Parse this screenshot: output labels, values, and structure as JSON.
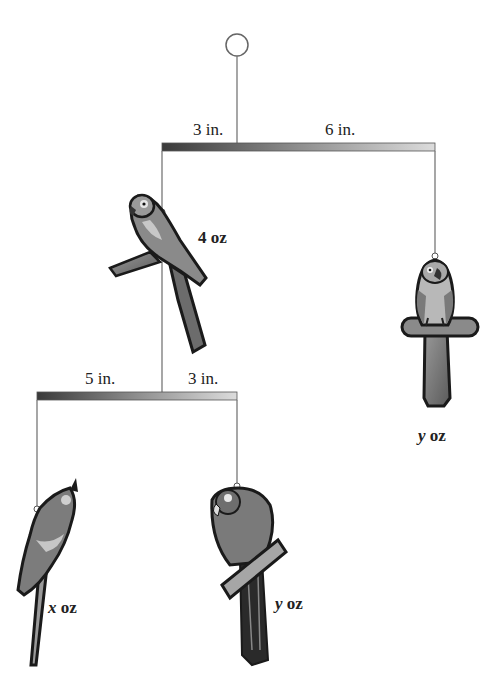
{
  "diagram": {
    "type": "hanging mobile (balance)",
    "top_bar": {
      "left_length_label": "3 in.",
      "right_length_label": "6 in."
    },
    "lower_bar": {
      "left_length_label": "5 in.",
      "right_length_label": "3 in."
    },
    "weights": {
      "top_left_parrot": {
        "var": "4",
        "unit": "oz",
        "label": "4 oz"
      },
      "top_right_parrot": {
        "var": "y",
        "unit": "oz",
        "label": "y oz"
      },
      "bottom_left_parrot": {
        "var": "x",
        "unit": "oz",
        "label": "x oz"
      },
      "bottom_right_parrot": {
        "var": "y",
        "unit": "oz",
        "label": "y oz"
      }
    }
  },
  "colors": {
    "line": "#777777",
    "bar_dark": "#3a3a3a",
    "bar_light": "#d8d8d8",
    "parrot_outline": "#1a1a1a",
    "parrot_body": "#8a8a8a",
    "parrot_light": "#bdbdbd"
  }
}
